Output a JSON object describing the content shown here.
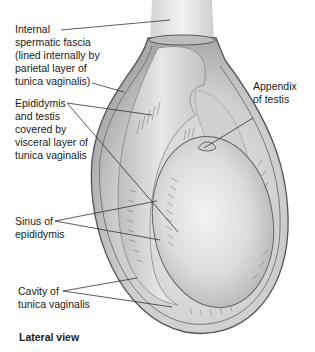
{
  "figure": {
    "caption": "Lateral view",
    "labels": {
      "internal_spermatic_fascia": [
        "Internal",
        "spermatic fascia",
        "(lined internally by",
        "parietal layer of",
        "tunica vaginalis)"
      ],
      "epididymis_and_testis": [
        "Epididymis",
        "and testis",
        "covered by",
        "visceral layer of",
        "tunica vaginalis"
      ],
      "appendix_of_testis": [
        "Appendix",
        "of testis"
      ],
      "sinus_of_epididymis": [
        "Sinus of",
        "epididymis"
      ],
      "cavity_of_tunica_vaginalis": [
        "Cavity of",
        "tunica vaginalis"
      ]
    },
    "colors": {
      "background": "#ffffff",
      "outer_sac": "#c9c9c9",
      "inner_tissue": "#d8d8d8",
      "testis": "#e4e4e4",
      "outline": "#555555",
      "leader_line": "#333333"
    }
  }
}
